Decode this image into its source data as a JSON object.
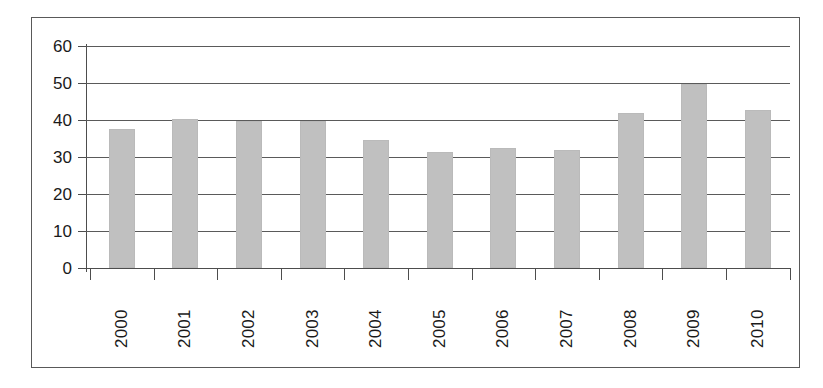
{
  "chart_data": {
    "type": "bar",
    "title": "",
    "subtitle": "",
    "xlabel": "",
    "ylabel": "",
    "categories": [
      "2000",
      "2001",
      "2002",
      "2003",
      "2004",
      "2005",
      "2006",
      "2007",
      "2008",
      "2009",
      "2010"
    ],
    "values": [
      37.5,
      40.3,
      39.8,
      39.6,
      34.7,
      31.4,
      32.5,
      32.0,
      42.0,
      49.8,
      42.8
    ],
    "ylim": [
      0,
      60
    ],
    "ytick_labels": [
      "60",
      "50",
      "40",
      "30",
      "20",
      "10",
      "0"
    ],
    "ytick_values": [
      60,
      50,
      40,
      30,
      20,
      10,
      0
    ],
    "grid": true,
    "grid_axis": "y",
    "legend": false,
    "legend_position": "none",
    "bar_color": "#c0c0c0",
    "axis_color": "#4d4d4d",
    "gridline_color": "#5a5a5a",
    "frame_color": "#595959",
    "text_color": "#1a1a1a",
    "xtick_label_rotation": 90
  }
}
